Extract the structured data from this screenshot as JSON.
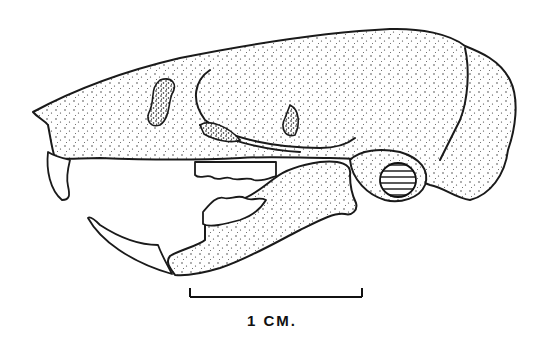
{
  "figure": {
    "scale_bar": {
      "label": "1 CM.",
      "x_start": 190,
      "x_end": 362,
      "y": 297
    },
    "colors": {
      "ink": "#1a1a1a",
      "background": "#ffffff"
    }
  }
}
